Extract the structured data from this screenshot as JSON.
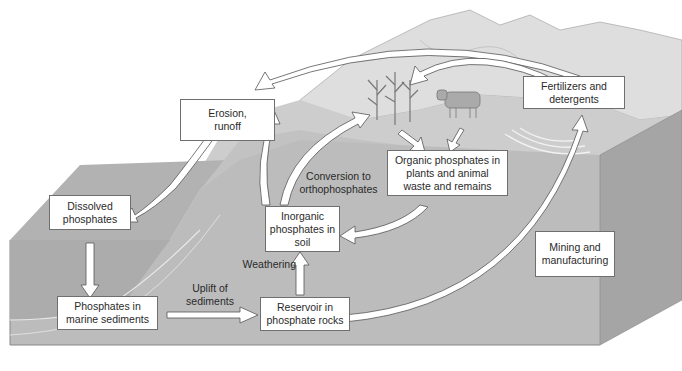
{
  "colors": {
    "front_face": "#bdbdbd",
    "side_face": "#a3a3a3",
    "land_top": "#c9c9c9",
    "ocean_top": "#a9a9a9",
    "mountain": "#dcdcdc",
    "box_border": "#6f6f6f",
    "arrow_fill": "#ffffff",
    "arrow_stroke": "#5a5a5a"
  },
  "boxes": {
    "erosion": "Erosion, runoff",
    "fertilizers": "Fertilizers and detergents",
    "organic": "Organic phosphates in plants and animal waste and remains",
    "inorganic": "Inorganic phosphates in soil",
    "dissolved": "Dissolved phosphates",
    "marine": "Phosphates in marine sediments",
    "reservoir": "Reservoir in phosphate rocks",
    "mining": "Mining and manufacturing"
  },
  "labels": {
    "conversion": "Conversion to orthophosphates",
    "weathering": "Weathering",
    "uplift": "Uplift of sediments"
  },
  "illustrations": [
    "corn-plants",
    "cow",
    "mountains",
    "phosphate-deposit-rings"
  ]
}
